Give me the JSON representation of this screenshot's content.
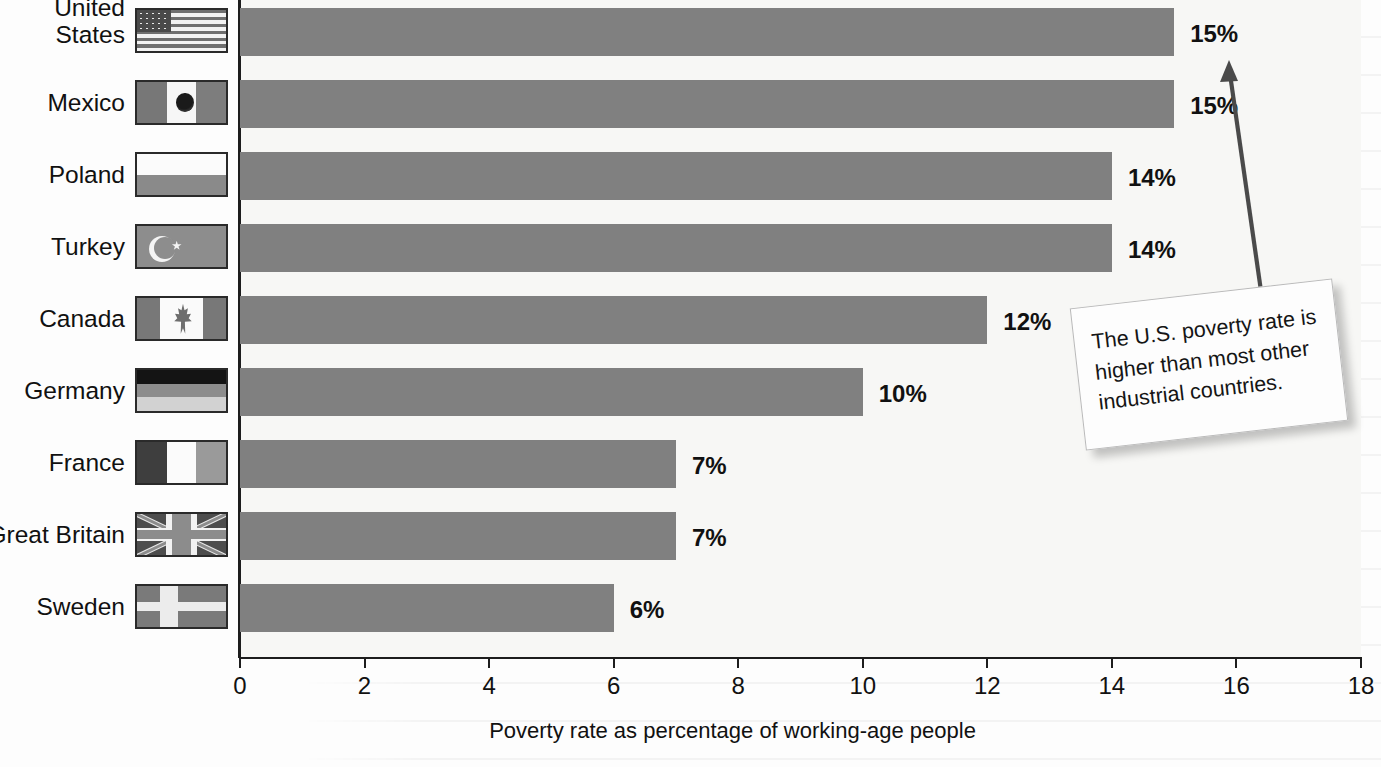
{
  "chart_data": {
    "type": "bar",
    "orientation": "horizontal",
    "title": "",
    "xlabel": "Poverty rate as percentage of working-age people",
    "ylabel": "",
    "xlim": [
      0,
      18
    ],
    "xticks": [
      "0",
      "2",
      "4",
      "6",
      "8",
      "10",
      "12",
      "14",
      "16",
      "18"
    ],
    "xtick_values": [
      0,
      2,
      4,
      6,
      8,
      10,
      12,
      14,
      16,
      18
    ],
    "grid": false,
    "legend": "none",
    "bar_color": "#808080",
    "categories": [
      "United States",
      "Mexico",
      "Poland",
      "Turkey",
      "Canada",
      "Germany",
      "France",
      "Great Britain",
      "Sweden"
    ],
    "values": [
      15,
      15,
      14,
      14,
      12,
      10,
      7,
      7,
      6
    ],
    "value_labels": [
      "15%",
      "15%",
      "14%",
      "14%",
      "12%",
      "10%",
      "7%",
      "7%",
      "6%"
    ],
    "annotation": "The U.S. poverty rate is higher than most other industrial countries."
  },
  "rows": [
    {
      "label_line1": "United",
      "label_line2": "States",
      "value": 15,
      "value_label": "15%",
      "flag": "flag-united-states"
    },
    {
      "label_line1": "Mexico",
      "label_line2": "",
      "value": 15,
      "value_label": "15%",
      "flag": "flag-mexico"
    },
    {
      "label_line1": "Poland",
      "label_line2": "",
      "value": 14,
      "value_label": "14%",
      "flag": "flag-poland"
    },
    {
      "label_line1": "Turkey",
      "label_line2": "",
      "value": 14,
      "value_label": "14%",
      "flag": "flag-turkey"
    },
    {
      "label_line1": "Canada",
      "label_line2": "",
      "value": 12,
      "value_label": "12%",
      "flag": "flag-canada"
    },
    {
      "label_line1": "Germany",
      "label_line2": "",
      "value": 10,
      "value_label": "10%",
      "flag": "flag-germany"
    },
    {
      "label_line1": "France",
      "label_line2": "",
      "value": 7,
      "value_label": "7%",
      "flag": "flag-france"
    },
    {
      "label_line1": "Great Britain",
      "label_line2": "",
      "value": 7,
      "value_label": "7%",
      "flag": "flag-great-britain"
    },
    {
      "label_line1": "Sweden",
      "label_line2": "",
      "value": 6,
      "value_label": "6%",
      "flag": "flag-sweden"
    }
  ],
  "axis": {
    "title": "Poverty rate as percentage of working-age people",
    "ticks": [
      "0",
      "2",
      "4",
      "6",
      "8",
      "10",
      "12",
      "14",
      "16",
      "18"
    ]
  },
  "callout": {
    "text": "The U.S. poverty rate is higher than most other industrial countries.",
    "points_to": "United States"
  }
}
